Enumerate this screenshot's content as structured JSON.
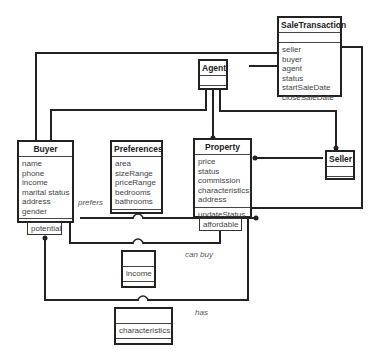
{
  "diagram": {
    "type": "uml-class-diagram",
    "classes": {
      "sale_transaction": {
        "name": "SaleTransaction",
        "attributes": [
          "seller",
          "buyer",
          "agent",
          "status",
          "startSaleDate",
          "closeSaleDate"
        ],
        "operations": []
      },
      "agent": {
        "name": "Agent",
        "attributes": [],
        "operations": []
      },
      "buyer": {
        "name": "Buyer",
        "attributes": [
          "name",
          "phone",
          "income",
          "marital status",
          "address",
          "gender"
        ],
        "operations": []
      },
      "preferences": {
        "name": "Preferences",
        "attributes": [
          "area",
          "sizeRange",
          "priceRange",
          "bedrooms",
          "bathrooms"
        ],
        "operations": []
      },
      "property": {
        "name": "Property",
        "attributes": [
          "price",
          "status",
          "commission",
          "characteristics",
          "address"
        ],
        "operations": [
          "updateStatus"
        ]
      },
      "seller": {
        "name": "Seller",
        "attributes": [],
        "operations": []
      },
      "income": {
        "name": "",
        "attributes": [
          "income"
        ],
        "operations": []
      },
      "characteristics": {
        "name": "",
        "attributes": [
          "characteristics"
        ],
        "operations": []
      }
    },
    "qualifiers": {
      "potential": "potential",
      "affordable": "affordable"
    },
    "association_labels": {
      "prefers": "prefers",
      "can_buy": "can buy",
      "has": "has"
    }
  }
}
